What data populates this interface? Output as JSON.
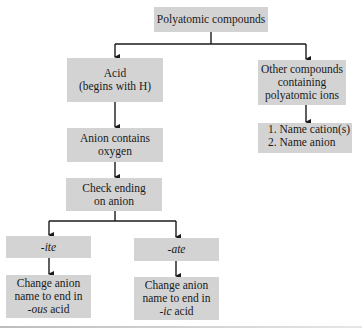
{
  "diagram": {
    "title": "Polyatomic compounds",
    "nodes": {
      "root": {
        "label": "Polyatomic compounds"
      },
      "acid": {
        "line1": "Acid",
        "line2": "(begins with H)"
      },
      "other": {
        "line1": "Other compounds",
        "line2": "containing",
        "line3": "polyatomic ions"
      },
      "other_steps": {
        "step1": "1.  Name cation(s)",
        "step2": "2.  Name anion"
      },
      "anion_oxygen": {
        "line1": "Anion contains",
        "line2": "oxygen"
      },
      "check_ending": {
        "line1": "Check ending",
        "line2": "on anion"
      },
      "ite": {
        "label": "-ite"
      },
      "ate": {
        "label": "-ate"
      },
      "ous_rule": {
        "line1": "Change anion",
        "line2": "name to end in",
        "suffix": "-ous",
        "tail": " acid"
      },
      "ic_rule": {
        "line1": "Change anion",
        "line2": "name to end in",
        "suffix": "-ic",
        "tail": " acid"
      }
    },
    "edges": [
      [
        "root",
        "acid"
      ],
      [
        "root",
        "other"
      ],
      [
        "other",
        "other_steps"
      ],
      [
        "acid",
        "anion_oxygen"
      ],
      [
        "anion_oxygen",
        "check_ending"
      ],
      [
        "check_ending",
        "ite"
      ],
      [
        "check_ending",
        "ate"
      ],
      [
        "ite",
        "ous_rule"
      ],
      [
        "ate",
        "ic_rule"
      ]
    ],
    "colors": {
      "box_fill": "#d3d3d3",
      "line": "#1a1a1a",
      "background": "#ffffff"
    }
  }
}
